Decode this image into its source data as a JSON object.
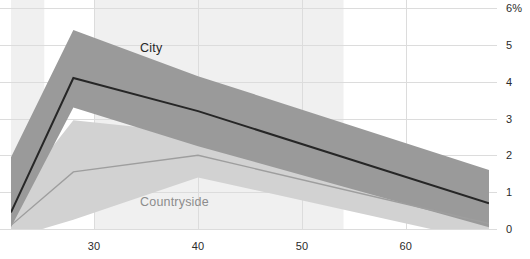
{
  "chart_data": {
    "type": "line",
    "title": "",
    "subtitle": "",
    "xlabel": "",
    "ylabel": "",
    "unit_suffix": "%",
    "xlim": [
      22,
      68
    ],
    "ylim": [
      0,
      6
    ],
    "xticks": [
      30,
      40,
      50,
      60
    ],
    "xtick_labels": [
      "30",
      "40",
      "50",
      "60"
    ],
    "yticks": [
      0,
      1,
      2,
      3,
      4,
      5,
      6
    ],
    "ytick_labels": [
      "0",
      "1",
      "2",
      "3",
      "4",
      "5",
      "6%"
    ],
    "grid": true,
    "grid_axis": "both",
    "legend": "inline-annotation",
    "x": [
      22,
      28,
      40,
      68
    ],
    "series": [
      {
        "name": "City",
        "color": "#262626",
        "band_color": "#9a9a9a",
        "values": [
          0.45,
          4.1,
          3.2,
          0.7
        ],
        "band_upper": [
          1.95,
          5.4,
          4.15,
          1.6
        ],
        "band_lower": [
          0.05,
          3.3,
          2.25,
          0.05
        ]
      },
      {
        "name": "Countryside",
        "color": "#9e9e9e",
        "band_color": "#d2d2d2",
        "values": [
          0.1,
          1.55,
          2.0,
          0.15
        ],
        "band_upper": [
          0.8,
          2.95,
          2.6,
          0.6
        ],
        "band_lower": [
          -0.25,
          0.25,
          1.4,
          -0.35
        ]
      }
    ],
    "annotations": [
      {
        "text": "City",
        "x_px": 140,
        "y_px": 42
      },
      {
        "text": "Countryside",
        "x_px": 140,
        "y_px": 196
      }
    ],
    "shaded_x_bands": [
      {
        "x0": 22.0,
        "x1": 25.2
      },
      {
        "x0": 30.0,
        "x1": 54.0
      }
    ],
    "colors": {
      "background": "#ffffff",
      "band_shade": "#f0f0f0",
      "gridline": "#dcdcdc",
      "axis_text": "#2b2b2b",
      "city_line": "#262626",
      "city_band": "#9a9a9a",
      "countryside_line": "#9e9e9e",
      "countryside_band": "#d2d2d2"
    }
  }
}
